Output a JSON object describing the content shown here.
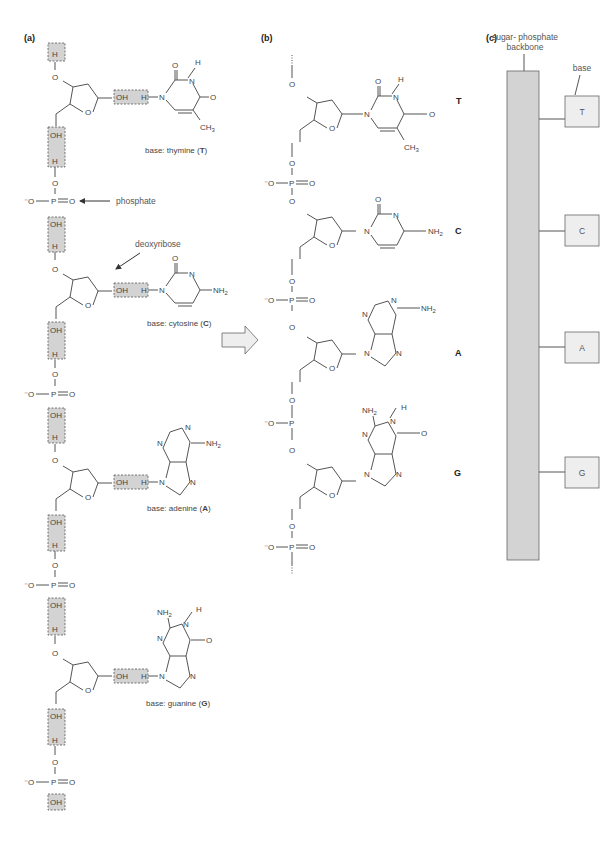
{
  "panels": {
    "a": {
      "label": "(a)",
      "annotations": {
        "phosphate": "phosphate",
        "deoxyribose": "deoxyribose"
      },
      "bases": [
        {
          "caption": "base: thymine (",
          "letter": "T",
          "close": ")"
        },
        {
          "caption": "base: cytosine (",
          "letter": "C",
          "close": ")"
        },
        {
          "caption": "base: adenine (",
          "letter": "A",
          "close": ")"
        },
        {
          "caption": "base: guanine (",
          "letter": "G",
          "close": ")"
        }
      ],
      "atoms": {
        "H": "H",
        "O": "O",
        "OH": "OH",
        "P": "P",
        "N": "N",
        "minusO": "⁻O",
        "CH3": "CH₃",
        "NH2": "NH₂"
      }
    },
    "b": {
      "label": "(b)",
      "letters": [
        "T",
        "C",
        "A",
        "G"
      ]
    },
    "c": {
      "label": "(c)",
      "backbone_label_1": "sugar- phosphate",
      "backbone_label_2": "backbone",
      "base_label": "base",
      "bases": [
        "T",
        "C",
        "A",
        "G"
      ]
    }
  },
  "colors": {
    "backbone_fill": "#d3d3d3",
    "base_fill": "#eeeeee",
    "line": "#555555"
  }
}
